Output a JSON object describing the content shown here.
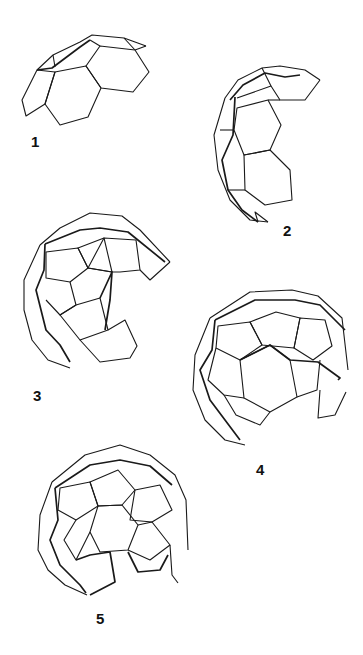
{
  "figure": {
    "type": "diagram",
    "stroke_color": "#1a1a1a",
    "background": "#ffffff",
    "panels": [
      {
        "label": "1",
        "stage": 1
      },
      {
        "label": "2",
        "stage": 2
      },
      {
        "label": "3",
        "stage": 3
      },
      {
        "label": "4",
        "stage": 4
      },
      {
        "label": "5",
        "stage": 5
      }
    ]
  }
}
